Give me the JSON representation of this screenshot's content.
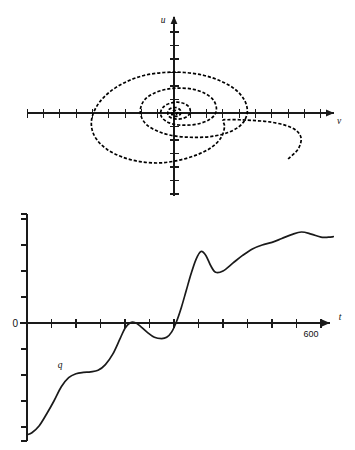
{
  "figure": {
    "title": "",
    "panels": [
      {
        "id": "phase-portrait",
        "type": "phase-plane-trajectory"
      },
      {
        "id": "time-series",
        "type": "time-series"
      }
    ]
  },
  "phase_plot": {
    "y_axis_label": "u",
    "x_axis_label": "v",
    "origin_px": {
      "x": 174,
      "y": 113
    },
    "x_axis_extent_px": {
      "left": 27,
      "right": 334
    },
    "y_axis_extent_px": {
      "top": 16,
      "bottom": 196
    },
    "x_tick_spacing_px": 16.3,
    "y_tick_spacing_px": 13.5
  },
  "time_plot": {
    "x_axis_label": "t",
    "zero_label": "0",
    "end_tick_label": "600",
    "curve_label": "q",
    "origin_px": {
      "x": 27,
      "y": 118
    },
    "x_axis_extent_px": {
      "left": 20,
      "right": 330
    },
    "y_axis_extent_px": {
      "top": 9,
      "bottom": 236
    },
    "x_tick_spacing_px": 24.5,
    "y_tick_spacing_px": 26.0
  },
  "chart_data": [
    {
      "type": "line",
      "id": "phase-portrait",
      "title": "",
      "subtitle": "",
      "xlabel": "v",
      "ylabel": "u",
      "grid": false,
      "legend": null,
      "annotations": [],
      "axis_style": "cartesian-arrows-with-ticks",
      "xlim": [
        -9.0,
        9.8
      ],
      "ylim": [
        -6.2,
        7.2
      ],
      "xticks": [
        -9,
        -8,
        -7,
        -6,
        -5,
        -4,
        -3,
        -2,
        -1,
        0,
        1,
        2,
        3,
        4,
        5,
        6,
        7,
        8,
        9
      ],
      "yticks": [
        -6,
        -5,
        -4,
        -3,
        -2,
        -1,
        0,
        1,
        2,
        3,
        4,
        5,
        6,
        7
      ],
      "xticklabels": [],
      "yticklabels": [],
      "series": [
        {
          "name": "trajectory",
          "style": "dashed",
          "description": "inward spiral converging on the origin",
          "points": [
            [
              7.0,
              -3.4
            ],
            [
              7.6,
              -2.7
            ],
            [
              7.8,
              -1.9
            ],
            [
              7.5,
              -1.3
            ],
            [
              6.8,
              -0.9
            ],
            [
              5.8,
              -0.65
            ],
            [
              4.8,
              -0.55
            ],
            [
              4.0,
              -0.5
            ],
            [
              3.3,
              -0.5
            ],
            [
              3.0,
              -0.55
            ],
            [
              3.1,
              -1.0
            ],
            [
              2.9,
              -1.8
            ],
            [
              2.3,
              -2.55
            ],
            [
              1.4,
              -3.1
            ],
            [
              0.3,
              -3.5
            ],
            [
              -0.9,
              -3.7
            ],
            [
              -2.1,
              -3.6
            ],
            [
              -3.2,
              -3.25
            ],
            [
              -4.1,
              -2.7
            ],
            [
              -4.75,
              -1.95
            ],
            [
              -5.05,
              -1.1
            ],
            [
              -5.0,
              -0.2
            ],
            [
              -4.6,
              0.75
            ],
            [
              -3.9,
              1.6
            ],
            [
              -2.95,
              2.3
            ],
            [
              -1.85,
              2.78
            ],
            [
              -0.6,
              3.0
            ],
            [
              0.65,
              3.0
            ],
            [
              1.85,
              2.78
            ],
            [
              2.9,
              2.35
            ],
            [
              3.75,
              1.75
            ],
            [
              4.3,
              1.0
            ],
            [
              4.5,
              0.2
            ],
            [
              4.35,
              -0.5
            ],
            [
              3.95,
              -1.05
            ],
            [
              3.3,
              -1.45
            ],
            [
              2.5,
              -1.7
            ],
            [
              1.6,
              -1.8
            ],
            [
              0.7,
              -1.78
            ],
            [
              -0.2,
              -1.65
            ],
            [
              -1.0,
              -1.35
            ],
            [
              -1.65,
              -0.9
            ],
            [
              -2.0,
              -0.3
            ],
            [
              -2.05,
              0.35
            ],
            [
              -1.8,
              0.98
            ],
            [
              -1.25,
              1.45
            ],
            [
              -0.5,
              1.75
            ],
            [
              0.35,
              1.85
            ],
            [
              1.2,
              1.75
            ],
            [
              1.9,
              1.45
            ],
            [
              2.4,
              0.98
            ],
            [
              2.6,
              0.4
            ],
            [
              2.5,
              -0.12
            ],
            [
              2.15,
              -0.5
            ],
            [
              1.65,
              -0.75
            ],
            [
              1.1,
              -0.88
            ],
            [
              0.5,
              -0.9
            ],
            [
              -0.05,
              -0.82
            ],
            [
              -0.5,
              -0.6
            ],
            [
              -0.78,
              -0.25
            ],
            [
              -0.8,
              0.15
            ],
            [
              -0.6,
              0.5
            ],
            [
              -0.25,
              0.72
            ],
            [
              0.2,
              0.8
            ],
            [
              0.62,
              0.7
            ],
            [
              0.92,
              0.45
            ],
            [
              1.0,
              0.12
            ],
            [
              0.88,
              -0.18
            ],
            [
              0.6,
              -0.38
            ],
            [
              0.25,
              -0.45
            ],
            [
              -0.1,
              -0.4
            ],
            [
              -0.33,
              -0.22
            ],
            [
              -0.38,
              0.05
            ],
            [
              -0.28,
              0.28
            ],
            [
              -0.05,
              0.4
            ],
            [
              0.2,
              0.38
            ],
            [
              0.38,
              0.22
            ],
            [
              0.42,
              0.0
            ],
            [
              0.32,
              -0.18
            ],
            [
              0.12,
              -0.25
            ],
            [
              -0.06,
              -0.2
            ],
            [
              -0.15,
              -0.05
            ],
            [
              -0.1,
              0.12
            ],
            [
              0.05,
              0.2
            ],
            [
              0.18,
              0.13
            ],
            [
              0.2,
              0.0
            ],
            [
              0.12,
              -0.1
            ],
            [
              0.0,
              -0.1
            ],
            [
              -0.05,
              0.0
            ],
            [
              0.0,
              0.05
            ]
          ]
        }
      ]
    },
    {
      "type": "line",
      "id": "time-series",
      "title": "",
      "subtitle": "",
      "xlabel": "t",
      "ylabel": "",
      "grid": false,
      "legend": null,
      "axis_style": "x-axis-arrow-with-ticks, y-axis-ticks-only",
      "xlim": [
        0,
        660
      ],
      "ylim": [
        -4.55,
        4.6
      ],
      "xticks": [
        0,
        50,
        100,
        150,
        200,
        250,
        300,
        350,
        400,
        450,
        500,
        550,
        600
      ],
      "xticklabels": [
        "",
        "",
        "",
        "",
        "",
        "",
        "",
        "",
        "",
        "",
        "",
        "",
        "600"
      ],
      "yticks": [
        -4,
        -3,
        -2,
        -1,
        0,
        1,
        2,
        3,
        4
      ],
      "yticklabels": [
        "",
        "",
        "",
        "",
        "0",
        "",
        "",
        "",
        ""
      ],
      "annotations": [
        {
          "text": "q",
          "x": 75,
          "y": -1.55,
          "style": "italic"
        }
      ],
      "series": [
        {
          "name": "q",
          "style": "solid",
          "x": [
            0,
            10,
            25,
            40,
            55,
            70,
            85,
            100,
            115,
            130,
            145,
            160,
            175,
            190,
            200,
            210,
            220,
            230,
            245,
            260,
            275,
            285,
            295,
            305,
            315,
            325,
            335,
            345,
            355,
            365,
            375,
            385,
            400,
            420,
            440,
            460,
            480,
            500,
            520,
            540,
            560,
            580,
            600,
            615,
            625
          ],
          "y": [
            -4.3,
            -4.22,
            -3.95,
            -3.5,
            -3.0,
            -2.45,
            -2.1,
            -1.95,
            -1.9,
            -1.88,
            -1.82,
            -1.6,
            -1.2,
            -0.6,
            -0.2,
            0.0,
            0.02,
            -0.1,
            -0.35,
            -0.55,
            -0.6,
            -0.55,
            -0.35,
            0.05,
            0.6,
            1.25,
            1.9,
            2.45,
            2.75,
            2.6,
            2.2,
            1.95,
            2.0,
            2.3,
            2.6,
            2.85,
            3.0,
            3.1,
            3.25,
            3.4,
            3.5,
            3.42,
            3.3,
            3.3,
            3.32
          ]
        }
      ]
    }
  ]
}
